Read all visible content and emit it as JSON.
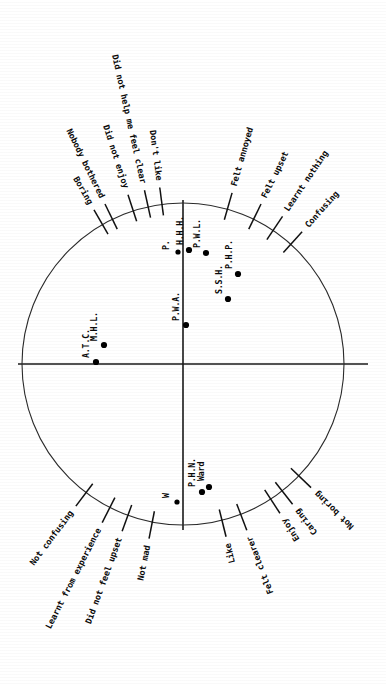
{
  "figure": {
    "title": "",
    "background_color": "#ffffff",
    "ink_color": "#111111",
    "orientation_note": "rotated",
    "center": {
      "x": 183,
      "y": 364
    },
    "radius": 161
  },
  "chart_data": {
    "type": "scatter",
    "title": "",
    "subtitle": "",
    "xlabel": "",
    "ylabel": "",
    "xlim": [
      -1,
      1
    ],
    "ylim": [
      -1,
      1
    ],
    "grid": false,
    "legend": "none",
    "unit_circle": true,
    "axes": {
      "horizontal_axis_y": 364,
      "vertical_axis_x": 183,
      "show_horizontal": true,
      "show_vertical": true
    },
    "points": [
      {
        "label": "A.T.C.",
        "px": 96,
        "py": 362,
        "x": -0.54,
        "y": 0.012,
        "label_dx": -7,
        "label_dy": -4
      },
      {
        "label": "M.H.L.",
        "px": 104,
        "py": 345,
        "x": -0.491,
        "y": 0.118,
        "label_dx": -7,
        "label_dy": -4
      },
      {
        "label": "P.W.A.",
        "px": 186,
        "py": 325,
        "x": 0.019,
        "y": 0.242,
        "label_dx": -7,
        "label_dy": -4
      },
      {
        "label": "P.",
        "px": 178,
        "py": 252,
        "x": -0.031,
        "y": 0.696,
        "label_dx": -9,
        "label_dy": -2
      },
      {
        "label": "H.H.H.",
        "px": 189,
        "py": 250,
        "x": 0.037,
        "y": 0.708,
        "label_dx": -6,
        "label_dy": -5
      },
      {
        "label": "P.W.L.",
        "px": 206,
        "py": 253,
        "x": 0.143,
        "y": 0.689,
        "label_dx": -6,
        "label_dy": -5
      },
      {
        "label": "S.S.H.",
        "px": 228,
        "py": 299,
        "x": 0.28,
        "y": 0.404,
        "label_dx": -6,
        "label_dy": -5
      },
      {
        "label": "P.H.P.",
        "px": 238,
        "py": 274,
        "x": 0.342,
        "y": 0.559,
        "label_dx": -6,
        "label_dy": -5
      },
      {
        "label": "W",
        "px": 177,
        "py": 502,
        "x": -0.037,
        "y": -0.857,
        "label_dx": -8,
        "label_dy": -4
      },
      {
        "label": "P.H.N.",
        "px": 202,
        "py": 492,
        "x": 0.118,
        "y": -0.795,
        "label_dx": -7,
        "label_dy": -5
      },
      {
        "label": "Ward",
        "px": 209,
        "py": 487,
        "x": 0.161,
        "y": -0.764,
        "label_dx": -5,
        "label_dy": -6
      }
    ],
    "spokes": [
      {
        "label": "Boring",
        "angle_deg": 120.0,
        "side": "upper-left"
      },
      {
        "label": "Nobody bothered",
        "angle_deg": 116.0,
        "side": "upper-left"
      },
      {
        "label": "Did not enjoy",
        "angle_deg": 108.0,
        "side": "upper-left"
      },
      {
        "label": "Did not help me feel clear",
        "angle_deg": 102.5,
        "side": "upper-left"
      },
      {
        "label": "Don't like",
        "angle_deg": 97.5,
        "side": "upper-left"
      },
      {
        "label": "Felt annoyed",
        "angle_deg": 74.0,
        "side": "upper-right"
      },
      {
        "label": "Felt upset",
        "angle_deg": 64.0,
        "side": "upper-right"
      },
      {
        "label": "Learnt nothing",
        "angle_deg": 56.0,
        "side": "upper-right"
      },
      {
        "label": "Confusing",
        "angle_deg": 48.0,
        "side": "upper-right"
      },
      {
        "label": "Not confusing",
        "angle_deg": 233.0,
        "side": "lower-left"
      },
      {
        "label": "Learnt from experience",
        "angle_deg": 243.0,
        "side": "lower-left"
      },
      {
        "label": "Did not feel upset",
        "angle_deg": 250.0,
        "side": "lower-left"
      },
      {
        "label": "Not mad",
        "angle_deg": 259.0,
        "side": "lower-left"
      },
      {
        "label": "Like",
        "angle_deg": 284.0,
        "side": "lower-right"
      },
      {
        "label": "Felt clearer",
        "angle_deg": 291.0,
        "side": "lower-right"
      },
      {
        "label": "Enjoy",
        "angle_deg": 303.0,
        "side": "lower-right"
      },
      {
        "label": "Caring",
        "angle_deg": 308.0,
        "side": "lower-right"
      },
      {
        "label": "Not boring",
        "angle_deg": 316.0,
        "side": "lower-right"
      }
    ]
  }
}
